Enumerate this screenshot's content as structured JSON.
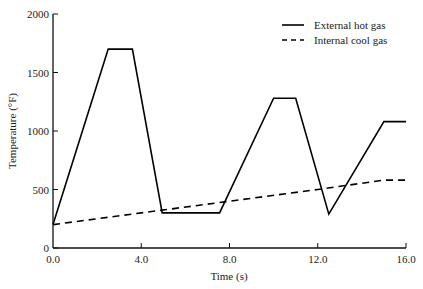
{
  "chart_data": {
    "type": "line",
    "title": "",
    "xlabel": "Time (s)",
    "ylabel": "Temperature (°F)",
    "xlim": [
      0,
      16
    ],
    "ylim": [
      0,
      2000
    ],
    "xticks": [
      0,
      4,
      8,
      12,
      16
    ],
    "xtick_labels": [
      "0.0",
      "4.0",
      "8.0",
      "12.0",
      "16.0"
    ],
    "yticks": [
      0,
      500,
      1000,
      1500,
      2000
    ],
    "ytick_labels": [
      "0",
      "500",
      "1000",
      "1500",
      "2000"
    ],
    "grid": false,
    "legend_position": "upper right",
    "series": [
      {
        "name": "External hot gas",
        "style": "solid",
        "color": "#000000",
        "x": [
          0,
          2.5,
          3.6,
          4.95,
          7.55,
          10.0,
          11.0,
          12.5,
          15.0,
          16.0
        ],
        "y": [
          200,
          1700,
          1700,
          300,
          300,
          1280,
          1280,
          290,
          1080,
          1080
        ]
      },
      {
        "name": "Internal cool gas",
        "style": "dashed",
        "color": "#000000",
        "x": [
          0,
          4,
          8,
          12,
          15,
          16
        ],
        "y": [
          200,
          300,
          400,
          500,
          580,
          580
        ]
      }
    ]
  }
}
